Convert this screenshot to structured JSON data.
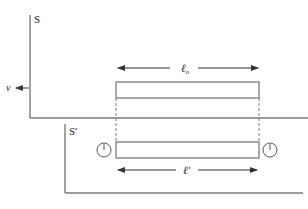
{
  "diagram": {
    "frame_s": {
      "label": "S"
    },
    "frame_s_prime": {
      "label": "S′"
    },
    "velocity": {
      "label": "v",
      "direction": "left"
    },
    "rod_in_s": {
      "length_label": "ℓ",
      "length_subscript": "o"
    },
    "rod_in_s_prime": {
      "length_label": "ℓ′"
    },
    "clocks": [
      {
        "name": "left-clock",
        "icon": "clock-icon"
      },
      {
        "name": "right-clock",
        "icon": "clock-icon"
      }
    ],
    "colors": {
      "line": "#7a7a7a",
      "text": "#222222",
      "background": "#ffffff"
    }
  }
}
